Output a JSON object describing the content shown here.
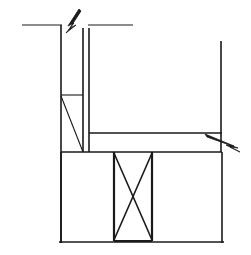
{
  "drawing": {
    "title": "Structural Section Detail",
    "type": "architectural-line-drawing",
    "background_color": "#ffffff",
    "line_color": "#1a1a1a",
    "canvas": {
      "width": 251,
      "height": 255
    },
    "style": {
      "thin_width": 1.1,
      "medium_width": 1.6,
      "thick_width": 2.2
    },
    "elements": {
      "top_left_reference_line": {
        "name": "top-left-horizontal-reference-line",
        "x1": 22,
        "y1": 25,
        "x2": 62,
        "y2": 25,
        "weight": "thin"
      },
      "top_right_reference_line": {
        "name": "top-right-horizontal-reference-line",
        "x1": 88,
        "y1": 25,
        "x2": 133,
        "y2": 25,
        "weight": "thin"
      },
      "wall_outer_face": {
        "name": "wall-outer-vertical-face",
        "x1": 61,
        "y1": 25,
        "x2": 61,
        "y2": 243,
        "weight": "medium"
      },
      "wall_inner_face_upper": {
        "name": "wall-inner-vertical-face-upper",
        "x1": 83,
        "y1": 28,
        "x2": 83,
        "y2": 152,
        "weight": "medium"
      },
      "wall_inner_face_outer_upper": {
        "name": "wall-inner-second-vertical-face",
        "x1": 89,
        "y1": 28,
        "x2": 89,
        "y2": 152,
        "weight": "medium"
      },
      "upper_ledge_line": {
        "name": "upper-ledge-horizontal-line",
        "x1": 61,
        "y1": 95,
        "x2": 83,
        "y2": 95,
        "weight": "thin"
      },
      "diagonal_brace": {
        "name": "diagonal-brace-line",
        "x1": 61,
        "y1": 96,
        "x2": 83,
        "y2": 152,
        "weight": "thin"
      },
      "beam_top_line": {
        "name": "beam-top-horizontal-line",
        "x1": 89,
        "y1": 133,
        "x2": 222,
        "y2": 133,
        "weight": "medium"
      },
      "beam_bottom_line": {
        "name": "beam-bottom-horizontal-line",
        "x1": 61,
        "y1": 152,
        "x2": 222,
        "y2": 152,
        "weight": "medium"
      },
      "right_vertical_line": {
        "name": "right-upper-vertical-line",
        "x1": 221,
        "y1": 41,
        "x2": 221,
        "y2": 152,
        "weight": "medium"
      },
      "slab_left_edge": {
        "name": "slab-left-vertical-edge",
        "x1": 61,
        "y1": 152,
        "x2": 61,
        "y2": 243,
        "weight": "medium"
      },
      "slab_right_edge": {
        "name": "slab-right-vertical-edge",
        "x1": 222,
        "y1": 152,
        "x2": 222,
        "y2": 243,
        "weight": "medium"
      },
      "slab_bottom_edge": {
        "name": "slab-bottom-horizontal-edge",
        "x1": 59,
        "y1": 242,
        "x2": 224,
        "y2": 242,
        "weight": "medium"
      },
      "panel_left_edge": {
        "name": "braced-panel-left-edge",
        "x1": 114,
        "y1": 152,
        "x2": 114,
        "y2": 241,
        "weight": "thick"
      },
      "panel_right_edge": {
        "name": "braced-panel-right-edge",
        "x1": 152,
        "y1": 152,
        "x2": 152,
        "y2": 241,
        "weight": "thick"
      },
      "panel_bottom_edge": {
        "name": "braced-panel-bottom-edge",
        "x1": 114,
        "y1": 241,
        "x2": 152,
        "y2": 241,
        "weight": "thick"
      },
      "cross_brace_a": {
        "name": "cross-brace-diagonal-a",
        "x1": 114,
        "y1": 153,
        "x2": 152,
        "y2": 240,
        "weight": "medium"
      },
      "cross_brace_b": {
        "name": "cross-brace-diagonal-b",
        "x1": 152,
        "y1": 153,
        "x2": 114,
        "y2": 240,
        "weight": "medium"
      },
      "break_symbol_top": {
        "name": "break-symbol-top",
        "description": "zigzag break arrow pointing up-right at top of wall",
        "points": "81,11 70,28 76,25 66,33 74,23 68,26 79,9",
        "arrow_tip": {
          "x": 81,
          "y": 11
        }
      },
      "break_symbol_right": {
        "name": "break-symbol-right",
        "description": "zigzag break arrow pointing down-right at beam end",
        "points": "207,137 238,148 230,147 240,152 226,145 234,146 205,134",
        "arrow_tip": {
          "x": 240,
          "y": 152
        }
      }
    }
  }
}
